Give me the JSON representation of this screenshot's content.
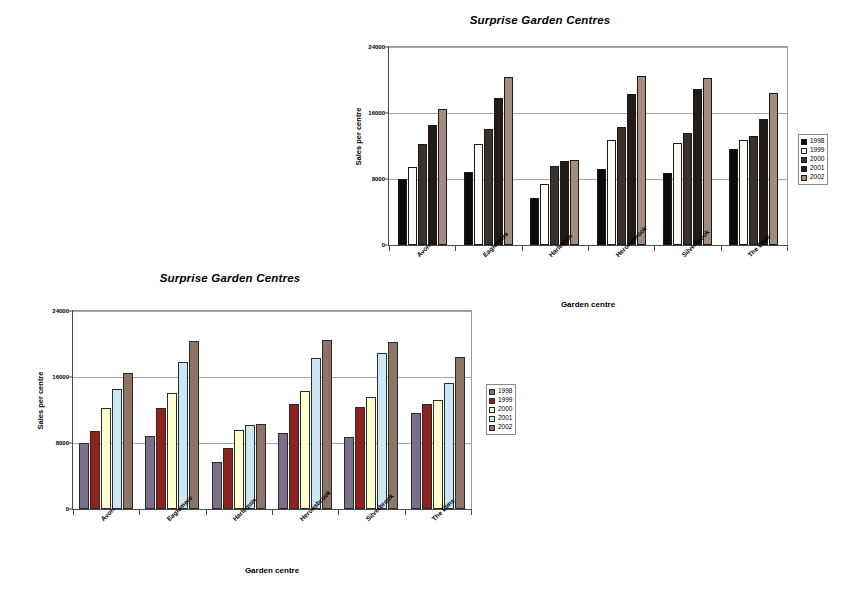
{
  "page": {
    "background": "#ffffff"
  },
  "charts": [
    {
      "id": "chart-top",
      "chart_data": {
        "type": "bar",
        "title": "Surprise Garden Centres",
        "xlabel": "Garden centre",
        "ylabel": "Sales per centre",
        "categories": [
          "Avon",
          "Eaglemere",
          "Harlequin",
          "Heronsbrook",
          "Silverbrook",
          "The Elms"
        ],
        "yticks": [
          "0",
          "8000",
          "16000",
          "24000"
        ],
        "ytick_values": [
          0,
          8000,
          16000,
          24000
        ],
        "ylim": [
          0,
          24000
        ],
        "grid": true,
        "legend_position": "right",
        "series": [
          {
            "name": "1998",
            "color": "#0d0b09",
            "values": [
              8000,
              8800,
              5700,
              9200,
              8700,
              11600
            ]
          },
          {
            "name": "1999",
            "color": "#fdfcf8",
            "values": [
              9500,
              12200,
              7400,
              12700,
              12400,
              12700
            ]
          },
          {
            "name": "2000",
            "color": "#3a322b",
            "values": [
              12300,
              14100,
              9600,
              14300,
              13600,
              13200
            ]
          },
          {
            "name": "2001",
            "color": "#221b16",
            "values": [
              14600,
              17800,
              10200,
              18300,
              18900,
              15300
            ]
          },
          {
            "name": "2002",
            "color": "#a08d80",
            "values": [
              16500,
              20400,
              10300,
              20500,
              20300,
              18400
            ]
          }
        ]
      }
    },
    {
      "id": "chart-bottom",
      "chart_data": {
        "type": "bar",
        "title": "Surprise Garden Centres",
        "xlabel": "Garden centre",
        "ylabel": "Sales per centre",
        "categories": [
          "Avon",
          "Eaglemere",
          "Harlequin",
          "Heronsbrook",
          "Silverbrook",
          "The Elms"
        ],
        "yticks": [
          "0",
          "8000",
          "16000",
          "24000"
        ],
        "ytick_values": [
          0,
          8000,
          16000,
          24000
        ],
        "ylim": [
          0,
          24000
        ],
        "grid": true,
        "legend_position": "right",
        "series": [
          {
            "name": "1998",
            "color": "#7d6e8c",
            "values": [
              8000,
              8800,
              5700,
              9200,
              8700,
              11600
            ]
          },
          {
            "name": "1999",
            "color": "#8e2221",
            "values": [
              9500,
              12200,
              7400,
              12700,
              12400,
              12700
            ]
          },
          {
            "name": "2000",
            "color": "#fdfdce",
            "values": [
              12300,
              14100,
              9600,
              14300,
              13600,
              13200
            ]
          },
          {
            "name": "2001",
            "color": "#cbe7f4",
            "values": [
              14600,
              17800,
              10200,
              18300,
              18900,
              15300
            ]
          },
          {
            "name": "2002",
            "color": "#8c7466",
            "values": [
              16500,
              20400,
              10300,
              20500,
              20300,
              18400
            ]
          }
        ]
      }
    }
  ]
}
